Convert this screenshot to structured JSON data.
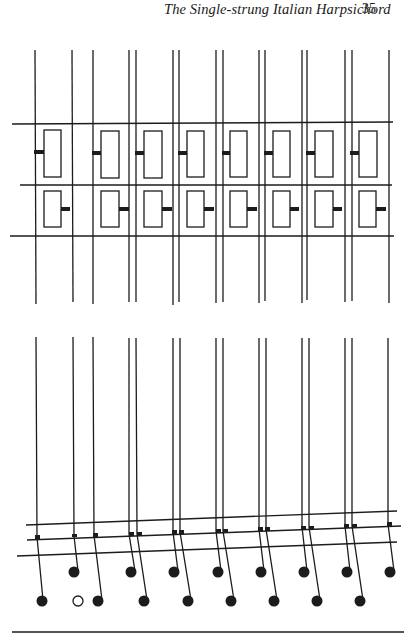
{
  "header": {
    "running_title": "The Single-strung Italian Harpsichord",
    "page_number": "35"
  },
  "colors": {
    "ink": "#1c1c1c",
    "paper": "#ffffff"
  },
  "upper_figure": {
    "description": "Plan view of jacks between strings: register rows with jack bodies and tongues",
    "string_x": [
      35,
      72,
      93,
      129,
      136,
      173,
      179,
      216,
      222,
      259,
      265,
      302,
      307,
      345,
      352,
      389
    ],
    "string_y_range": [
      50,
      302
    ],
    "rails_y": [
      124,
      185,
      236
    ],
    "upper_row_jacks": 8,
    "lower_row_jacks": 8
  },
  "lower_figure": {
    "description": "Side view of strings bending to note heads through sloping rails",
    "string_y_range": [
      337,
      530
    ],
    "rails": 3,
    "upper_note_count": 8,
    "lower_note_count": 9,
    "open_note_index": 1
  }
}
